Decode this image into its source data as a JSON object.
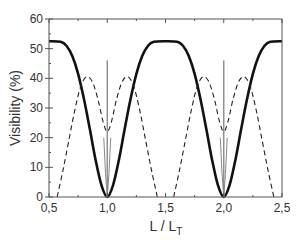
{
  "chart_data": {
    "type": "line",
    "title": "",
    "xlabel": "L / L",
    "xlabel_subscript": "T",
    "ylabel": "Visibility (%)",
    "xlim": [
      0.5,
      2.5
    ],
    "ylim": [
      0,
      60
    ],
    "x_ticks": [
      "0,5",
      "1,0",
      "1,5",
      "2,0",
      "2,5"
    ],
    "x_tick_values": [
      0.5,
      1.0,
      1.5,
      2.0,
      2.5
    ],
    "y_ticks": [
      "0",
      "10",
      "20",
      "30",
      "40",
      "50",
      "60"
    ],
    "y_tick_values": [
      0,
      10,
      20,
      30,
      40,
      50,
      60
    ],
    "grid": false,
    "legend": null,
    "series": [
      {
        "name": "thick-solid",
        "style": "solid",
        "color": "#111111",
        "width": 2.6,
        "x": [
          0.5,
          0.6,
          0.65,
          0.7,
          0.75,
          0.8,
          0.85,
          0.9,
          0.95,
          1.0,
          1.05,
          1.1,
          1.15,
          1.2,
          1.25,
          1.3,
          1.35,
          1.4,
          1.5,
          1.6,
          1.65,
          1.7,
          1.75,
          1.8,
          1.85,
          1.9,
          1.95,
          2.0,
          2.05,
          2.1,
          2.15,
          2.2,
          2.25,
          2.3,
          2.35,
          2.4,
          2.5
        ],
        "y": [
          52.5,
          52.3,
          51.0,
          47.5,
          41.5,
          33.0,
          23.0,
          12.5,
          4.0,
          0.0,
          4.0,
          12.5,
          23.0,
          33.0,
          41.5,
          47.5,
          51.0,
          52.3,
          52.5,
          52.3,
          51.0,
          47.5,
          41.5,
          33.0,
          23.0,
          12.5,
          4.0,
          0.0,
          4.0,
          12.5,
          23.0,
          33.0,
          41.5,
          47.5,
          51.0,
          52.3,
          52.5
        ]
      },
      {
        "name": "dashed",
        "style": "dashed",
        "color": "#222222",
        "width": 1.1,
        "x": [
          0.57,
          0.62,
          0.67,
          0.72,
          0.77,
          0.82,
          0.87,
          0.92,
          0.96,
          1.0,
          1.04,
          1.08,
          1.13,
          1.18,
          1.23,
          1.28,
          1.33,
          1.38,
          1.43,
          1.57,
          1.62,
          1.67,
          1.72,
          1.77,
          1.82,
          1.87,
          1.92,
          1.96,
          2.0,
          2.04,
          2.08,
          2.13,
          2.18,
          2.23,
          2.28,
          2.33,
          2.38,
          2.43
        ],
        "y": [
          0.0,
          9.0,
          19.0,
          29.0,
          37.0,
          40.5,
          39.0,
          33.0,
          26.0,
          22.0,
          26.0,
          33.0,
          39.0,
          40.5,
          37.0,
          29.0,
          19.0,
          9.0,
          0.0,
          0.0,
          9.0,
          19.0,
          29.0,
          37.0,
          40.5,
          39.0,
          33.0,
          26.0,
          22.0,
          26.0,
          33.0,
          39.0,
          40.5,
          37.0,
          29.0,
          19.0,
          9.0,
          0.0
        ]
      },
      {
        "name": "thin-gray",
        "style": "solid",
        "color": "#888888",
        "width": 1.0,
        "x": [
          0.97,
          0.985,
          1.0,
          1.0,
          1.0,
          1.015,
          1.03,
          1.97,
          1.985,
          2.0,
          2.0,
          2.0,
          2.015,
          2.03
        ],
        "y": [
          20.0,
          8.0,
          0.0,
          46.0,
          0.0,
          8.0,
          20.0,
          20.0,
          8.0,
          0.0,
          46.0,
          0.0,
          8.0,
          20.0
        ]
      }
    ]
  },
  "colors": {
    "axis": "#555555",
    "background": "#ffffff"
  }
}
